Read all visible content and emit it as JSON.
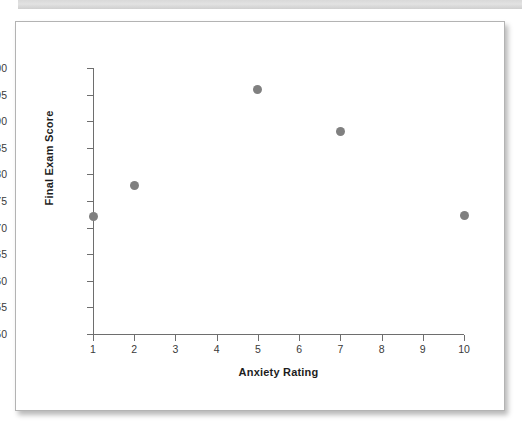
{
  "chart_data": {
    "type": "scatter",
    "title": "",
    "xlabel": "Anxiety Rating",
    "ylabel": "Final Exam Score",
    "xlim": [
      1,
      10
    ],
    "ylim": [
      50,
      100
    ],
    "grid": false,
    "legend": null,
    "marker_color": "#808080",
    "axis_color": "#6e6e6e",
    "xticks": [
      1,
      2,
      3,
      4,
      5,
      6,
      7,
      8,
      9,
      10
    ],
    "xticklabels": [
      "1",
      "2",
      "3",
      "4",
      "5",
      "6",
      "7",
      "8",
      "9",
      "10"
    ],
    "yticks": [
      50,
      55,
      60,
      65,
      70,
      75,
      80,
      85,
      90,
      95,
      100
    ],
    "yticklabels": [
      "50",
      "55",
      "60",
      "65",
      "70",
      "75",
      "80",
      "85",
      "90",
      "95",
      "100"
    ],
    "x": [
      1,
      2,
      5,
      7,
      10
    ],
    "y": [
      72,
      78,
      96,
      88,
      72.3
    ],
    "points": [
      {
        "x": 1,
        "y": 72
      },
      {
        "x": 2,
        "y": 78
      },
      {
        "x": 5,
        "y": 96
      },
      {
        "x": 7,
        "y": 88
      },
      {
        "x": 10,
        "y": 72.3
      }
    ]
  }
}
